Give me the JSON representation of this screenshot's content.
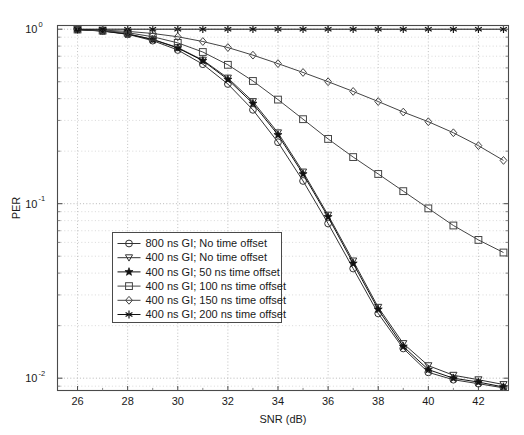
{
  "chart_data": {
    "type": "line",
    "title": "",
    "xlabel": "SNR (dB)",
    "ylabel": "PER",
    "xlim": [
      25.2,
      43.2
    ],
    "ylim": [
      0.0085,
      1.05
    ],
    "yscale": "log",
    "xscale": "linear",
    "grid": true,
    "grid_style": "dotted",
    "legend_position": "center-left",
    "xticks": [
      26,
      28,
      30,
      32,
      34,
      36,
      38,
      40,
      42
    ],
    "xtick_labels": [
      "26",
      "28",
      "30",
      "32",
      "34",
      "36",
      "38",
      "40",
      "42"
    ],
    "yticks": [
      1,
      0.1,
      0.01
    ],
    "ytick_labels": [
      "10^0",
      "10^-1",
      "10^-2"
    ],
    "x": [
      26,
      27,
      28,
      29,
      30,
      31,
      32,
      33,
      34,
      35,
      36,
      37,
      38,
      39,
      40,
      41,
      42,
      43
    ],
    "series": [
      {
        "name": "800 ns GI; No time offset",
        "marker": "circle",
        "color": "#333333",
        "values": [
          0.995,
          0.975,
          0.935,
          0.86,
          0.76,
          0.63,
          0.485,
          0.345,
          0.225,
          0.135,
          0.077,
          0.0425,
          0.0235,
          0.0148,
          0.0108,
          0.0098,
          0.0093,
          0.0088
        ]
      },
      {
        "name": "400 ns GI; No time offset",
        "marker": "triangle-down",
        "color": "#333333",
        "values": [
          0.995,
          0.978,
          0.94,
          0.875,
          0.785,
          0.665,
          0.525,
          0.385,
          0.255,
          0.152,
          0.086,
          0.047,
          0.0255,
          0.0158,
          0.0118,
          0.0104,
          0.0098,
          0.0092
        ]
      },
      {
        "name": "400 ns GI; 50 ns time offset",
        "marker": "star",
        "color": "#111111",
        "values": [
          0.995,
          0.977,
          0.938,
          0.872,
          0.78,
          0.66,
          0.515,
          0.375,
          0.248,
          0.148,
          0.084,
          0.0455,
          0.0248,
          0.0152,
          0.0112,
          0.01,
          0.0095,
          0.0089
        ]
      },
      {
        "name": "400 ns GI; 100 ns time offset",
        "marker": "square",
        "color": "#444444",
        "values": [
          0.996,
          0.982,
          0.955,
          0.905,
          0.835,
          0.74,
          0.625,
          0.505,
          0.395,
          0.305,
          0.235,
          0.185,
          0.148,
          0.118,
          0.094,
          0.075,
          0.062,
          0.0525
        ]
      },
      {
        "name": "400 ns GI; 150 ns time offset",
        "marker": "diamond",
        "color": "#444444",
        "values": [
          0.997,
          0.988,
          0.972,
          0.945,
          0.905,
          0.85,
          0.785,
          0.71,
          0.635,
          0.565,
          0.5,
          0.44,
          0.385,
          0.335,
          0.295,
          0.255,
          0.215,
          0.177
        ]
      },
      {
        "name": "400 ns GI; 200 ns time offset",
        "marker": "asterisk",
        "color": "#111111",
        "values": [
          1.0,
          1.0,
          1.0,
          1.0,
          1.0,
          1.0,
          1.0,
          1.0,
          1.0,
          1.0,
          1.0,
          1.0,
          1.0,
          1.0,
          1.0,
          1.0,
          1.0,
          1.0
        ]
      }
    ]
  },
  "legend": {
    "items": [
      "800 ns GI; No time offset",
      "400 ns GI; No time offset",
      "400 ns GI; 50 ns time offset",
      "400 ns GI; 100 ns time offset",
      "400 ns GI; 150 ns time offset",
      "400 ns GI; 200 ns time offset"
    ]
  },
  "axes": {
    "ylabel": "PER",
    "xlabel": "SNR (dB)",
    "ytick_mantissas": [
      "10",
      "10",
      "10"
    ],
    "ytick_exponents": [
      "0",
      "-1",
      "-2"
    ]
  }
}
